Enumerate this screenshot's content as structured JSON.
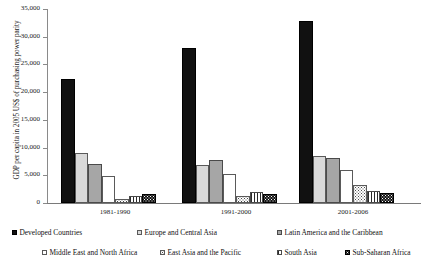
{
  "chart_data": {
    "type": "bar",
    "title": "",
    "xlabel": "",
    "ylabel": "GDP per capita in 2005 US$ of purchasing power parity",
    "ylim": [
      0,
      35000
    ],
    "grid": false,
    "legend_position": "bottom",
    "categories": [
      "1981-1990",
      "1991-2000",
      "2001-2006"
    ],
    "ytick_labels": [
      "35,000",
      "30,000",
      "25,000",
      "20,000",
      "15,000",
      "10,000",
      "5,000",
      "0"
    ],
    "ytick_values": [
      35000,
      30000,
      25000,
      20000,
      15000,
      10000,
      5000,
      0
    ],
    "series": [
      {
        "name": "Developed Countries",
        "key": "dev",
        "values": [
          22300,
          27900,
          32800
        ]
      },
      {
        "name": "Europe and Central Asia",
        "key": "eca",
        "values": [
          9000,
          6800,
          8500
        ]
      },
      {
        "name": "Latin America and the Caribbean",
        "key": "lac",
        "values": [
          7000,
          7700,
          8200
        ]
      },
      {
        "name": "Middle East and North Africa",
        "key": "mena",
        "values": [
          4800,
          5200,
          5900
        ]
      },
      {
        "name": "East Asia and the Pacific",
        "key": "eap",
        "values": [
          700,
          1300,
          3300
        ]
      },
      {
        "name": "South Asia",
        "key": "sa",
        "values": [
          1200,
          1900,
          2100
        ]
      },
      {
        "name": "Sub-Saharan Africa",
        "key": "ssa",
        "values": [
          1600,
          1700,
          1800
        ]
      }
    ]
  },
  "axis": {
    "y_title": "GDP per capita in 2005 US$ of purchasing power parity"
  },
  "legend": {
    "items": [
      {
        "label": "Developed Countries",
        "key": "dev"
      },
      {
        "label": "Europe and Central Asia",
        "key": "eca"
      },
      {
        "label": "Latin America and the Caribbean",
        "key": "lac"
      },
      {
        "label": "Middle East and North Africa",
        "key": "mena"
      },
      {
        "label": "East Asia and the Pacific",
        "key": "eap"
      },
      {
        "label": "South Asia",
        "key": "sa"
      },
      {
        "label": "Sub-Saharan Africa",
        "key": "ssa"
      }
    ]
  },
  "colors": {
    "developed": "#111111",
    "europe_central_asia": "#d9d9d9",
    "latin_america": "#a6a6a6",
    "middle_east": "#ffffff",
    "east_asia": "#ffffff",
    "south_asia": "#ffffff",
    "sub_saharan": "#151515",
    "axis": "#8a8a8a",
    "text": "#111111"
  }
}
